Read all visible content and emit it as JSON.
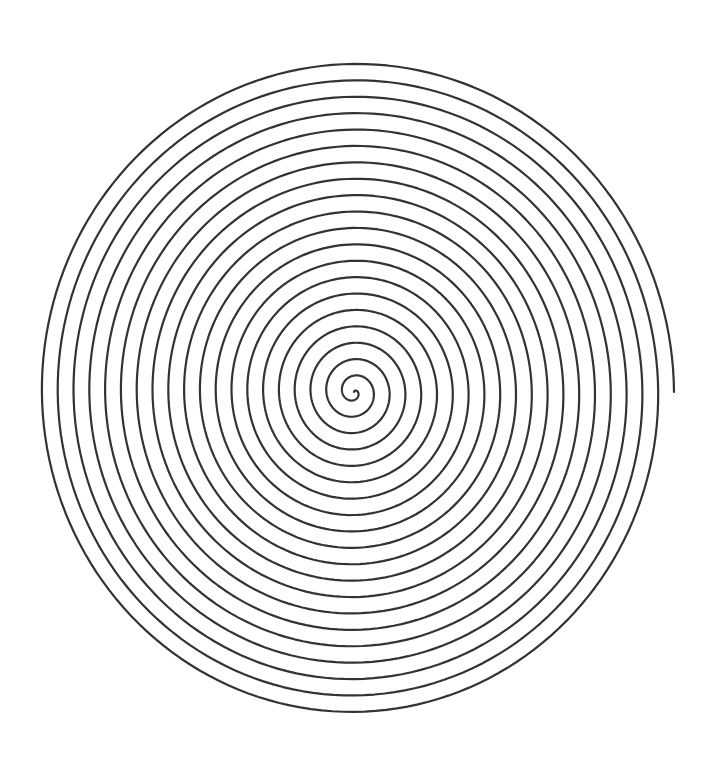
{
  "diagram": {
    "type": "archimedean-spiral",
    "background": "#ffffff",
    "stroke_color": "#333333",
    "stroke_width": 2.2,
    "center": {
      "x": 354,
      "y": 392
    },
    "outer_radius": 320,
    "turns": 20.25,
    "turn_spacing_px": 15.8,
    "vertical_scale": 1.038,
    "direction": "clockwise-outward",
    "end_angle_deg": 0
  }
}
